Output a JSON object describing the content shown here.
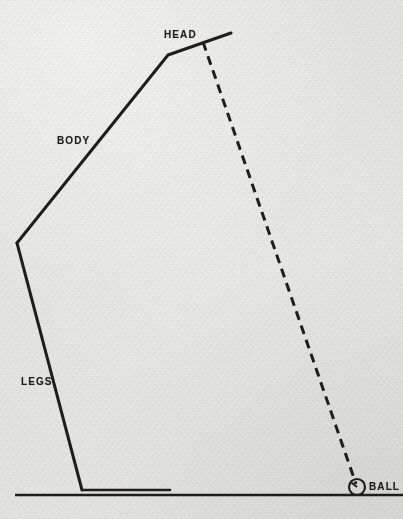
{
  "diagram": {
    "background_color": "#ebebe8",
    "ink_color": "#201e1c",
    "labels": {
      "head": "HEAD",
      "body": "BODY",
      "legs": "LEGS",
      "ball": "BALL"
    },
    "label_positions": {
      "head": {
        "x": 164,
        "y": 29
      },
      "body": {
        "x": 57,
        "y": 135
      },
      "legs": {
        "x": 21,
        "y": 376
      },
      "ball": {
        "x": 369,
        "y": 481
      }
    },
    "geometry": {
      "arm_tip": {
        "x": 231,
        "y": 33
      },
      "shoulder": {
        "x": 168,
        "y": 55
      },
      "hip": {
        "x": 17,
        "y": 243
      },
      "foot_joint": {
        "x": 82,
        "y": 490
      },
      "foot_end": {
        "x": 170,
        "y": 490
      },
      "ground_start": {
        "x": 15,
        "y": 495
      },
      "ground_end": {
        "x": 403,
        "y": 495
      },
      "swing_plane_start": {
        "x": 203,
        "y": 42
      },
      "swing_plane_end": {
        "x": 356,
        "y": 484
      },
      "ball_center": {
        "x": 357,
        "y": 487
      },
      "ball_radius": 8,
      "ball_hand_angle_deg": 218,
      "solid_stroke_width": 3,
      "dash_stroke_width": 3,
      "dash_pattern": "9 6",
      "ground_stroke_width": 2.4
    }
  }
}
